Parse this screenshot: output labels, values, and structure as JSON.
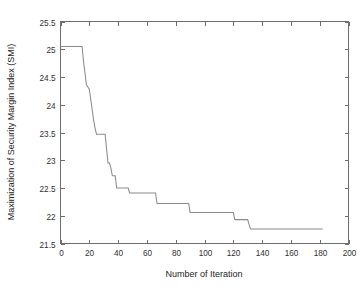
{
  "chart_data": {
    "type": "line",
    "title": "",
    "xlabel": "Number of Iteration",
    "ylabel": "Maximization of Security Margin Index (SMI)",
    "xlim": [
      0,
      200
    ],
    "ylim": [
      21.5,
      25.5
    ],
    "xticks": [
      0,
      20,
      40,
      60,
      80,
      100,
      120,
      140,
      160,
      180,
      200
    ],
    "xtick_labels": [
      "0",
      "20",
      "40",
      "60",
      "80",
      "100",
      "120",
      "140",
      "160",
      "180",
      "200"
    ],
    "yticks": [
      21.5,
      22,
      22.5,
      23,
      23.5,
      24,
      24.5,
      25,
      25.5
    ],
    "ytick_labels": [
      "21.5",
      "22",
      "22.5",
      "23",
      "23.5",
      "24",
      "24.5",
      "25",
      "25.5"
    ],
    "grid": false,
    "legend": false,
    "line_color": "#8a8a8a",
    "axis_color": "#6e6e6e",
    "background_color": "#ffffff",
    "series": [
      {
        "name": "Security Margin Index convergence",
        "style": "step-decreasing",
        "x": [
          0,
          15,
          16,
          18,
          20,
          21,
          23,
          24,
          25,
          31,
          32,
          33,
          34,
          35,
          36,
          38,
          39,
          47,
          48,
          66,
          67,
          89,
          90,
          120,
          121,
          130,
          131,
          132,
          182
        ],
        "y": [
          25.05,
          25.05,
          24.78,
          24.36,
          24.28,
          24.1,
          23.72,
          23.58,
          23.47,
          23.47,
          23.2,
          22.95,
          22.95,
          22.86,
          22.72,
          22.72,
          22.5,
          22.5,
          22.41,
          22.41,
          22.22,
          22.22,
          22.06,
          22.06,
          21.93,
          21.93,
          21.84,
          21.76,
          21.76
        ]
      }
    ],
    "annotations": [
      {
        "label": "initial plateau",
        "value": 25.05
      },
      {
        "label": "final converged value",
        "value": 21.76
      },
      {
        "label": "last iteration drawn",
        "value": 182
      }
    ]
  },
  "axis_titles": {
    "x": "Number of Iteration",
    "y": "Maximization of Security Margin Index (SMI)"
  }
}
